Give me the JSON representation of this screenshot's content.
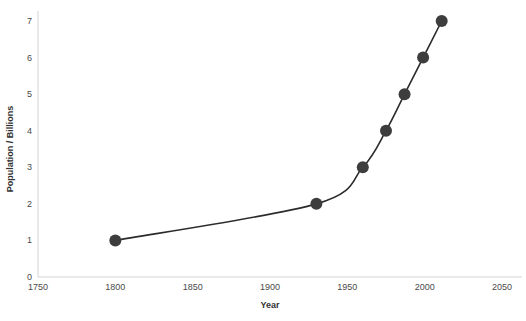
{
  "chart_data": {
    "type": "line",
    "title": "",
    "xlabel": "Year",
    "ylabel": "Population / Billions",
    "xlim": [
      1750,
      2050
    ],
    "ylim": [
      0,
      7
    ],
    "grid": false,
    "legend": null,
    "x_ticks": [
      1750,
      1800,
      1850,
      1900,
      1950,
      2000,
      2050
    ],
    "y_ticks": [
      0,
      1,
      2,
      3,
      4,
      5,
      6,
      7
    ],
    "series": [
      {
        "name": "World population",
        "marker": "circle",
        "marker_color": "#3d3d3d",
        "line_color": "#2b2b2b",
        "x": [
          1800,
          1930,
          1960,
          1975,
          1987,
          1999,
          2011
        ],
        "y": [
          1,
          2,
          3,
          4,
          5,
          6,
          7
        ],
        "points": [
          {
            "year": 1800,
            "population": 1
          },
          {
            "year": 1930,
            "population": 2
          },
          {
            "year": 1960,
            "population": 3
          },
          {
            "year": 1975,
            "population": 4
          },
          {
            "year": 1987,
            "population": 5
          },
          {
            "year": 1999,
            "population": 6
          },
          {
            "year": 2011,
            "population": 7
          }
        ]
      }
    ],
    "colors": {
      "axis": "#d4d4d4",
      "tick_text": "#4a4a4a",
      "axis_title": "#333333",
      "curve": "#2b2b2b",
      "marker": "#3d3d3d",
      "background": "#ffffff"
    }
  }
}
